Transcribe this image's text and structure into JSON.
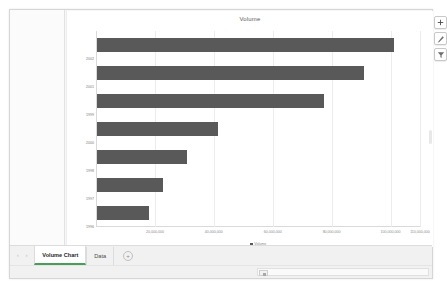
{
  "chart": {
    "title": "Volume",
    "bar_color": "#595959",
    "buttons": [
      {
        "name": "chart-elements-button",
        "label": "+"
      },
      {
        "name": "chart-styles-button",
        "label": "brush"
      },
      {
        "name": "chart-filters-button",
        "label": "filter"
      }
    ]
  },
  "legend": {
    "entry": "Volume"
  },
  "tabbar": {
    "nav_prev": "‹",
    "nav_next": "›",
    "tabs": [
      {
        "label": "Volume Chart",
        "active": true
      },
      {
        "label": "Data",
        "active": false
      }
    ],
    "add_sheet_label": "+"
  },
  "chart_data": {
    "type": "bar",
    "orientation": "horizontal",
    "title": "Volume",
    "xlabel": "",
    "ylabel": "",
    "grid": true,
    "legend_position": "bottom",
    "series": [
      {
        "name": "Volume",
        "values": [
          101000000,
          90500000,
          77000000,
          41000000,
          30500000,
          22500000,
          17500000
        ]
      }
    ],
    "categories": [
      "2002",
      "2001",
      "1999",
      "2000",
      "1998",
      "1997",
      "1996"
    ],
    "xlim": [
      0,
      110000000
    ],
    "xticks": [
      0,
      20000000,
      40000000,
      60000000,
      80000000,
      100000000,
      110000000
    ],
    "xticklabels": [
      "",
      "20,000,000",
      "40,000,000",
      "60,000,000",
      "80,000,000",
      "100,000,000",
      "110,000,000"
    ]
  }
}
